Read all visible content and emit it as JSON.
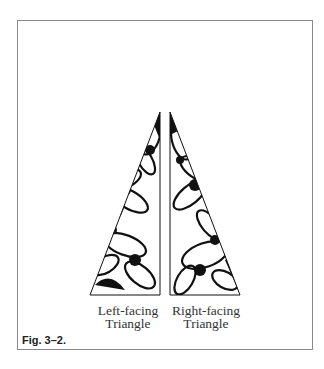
{
  "figure": {
    "caption": "Fig. 3–2.",
    "labels": {
      "left": [
        "Left-facing",
        "Triangle"
      ],
      "right": [
        "Right-facing",
        "Triangle"
      ]
    },
    "shapes": [
      {
        "name": "left-facing-triangle",
        "points": [
          [
            160,
            112
          ],
          [
            160,
            295
          ],
          [
            90,
            295
          ]
        ],
        "fill": "floral pattern"
      },
      {
        "name": "right-facing-triangle",
        "points": [
          [
            170,
            112
          ],
          [
            170,
            295
          ],
          [
            240,
            295
          ]
        ],
        "fill": "floral pattern"
      }
    ],
    "colors": {
      "stroke": "#111111",
      "frame": "#8a8a8a",
      "background": "#ffffff"
    }
  }
}
